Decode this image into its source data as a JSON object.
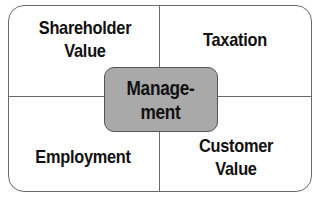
{
  "diagram": {
    "type": "quadrant",
    "quadrants": [
      {
        "position": "top-left",
        "line1": "Shareholder",
        "line2": "Value"
      },
      {
        "position": "top-right",
        "line1": "Taxation",
        "line2": ""
      },
      {
        "position": "bottom-left",
        "line1": "Employment",
        "line2": ""
      },
      {
        "position": "bottom-right",
        "line1": "Customer",
        "line2": "Value"
      }
    ],
    "center": {
      "line1": "Manage-",
      "line2": "ment",
      "fill": "#a9a9a9"
    },
    "colors": {
      "border": "#6a6a6a",
      "text": "#111111",
      "background": "#ffffff"
    }
  }
}
